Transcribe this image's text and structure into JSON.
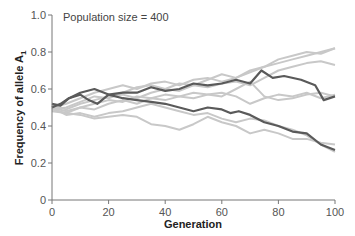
{
  "chart_data": {
    "type": "line",
    "title": "",
    "annotation": "Population size = 400",
    "xlabel": "Generation",
    "ylabel": "Frequency of allele A",
    "ylabel_subscript": "1",
    "xlim": [
      0,
      100
    ],
    "ylim": [
      0,
      1.0
    ],
    "xticks": [
      0,
      20,
      40,
      60,
      80,
      100
    ],
    "yticks": [
      0,
      0.2,
      0.4,
      0.6,
      0.8,
      1.0
    ],
    "xtick_labels": [
      "0",
      "20",
      "40",
      "60",
      "80",
      "100"
    ],
    "ytick_labels": [
      "0",
      "0.2",
      "0.4",
      "0.6",
      "0.8",
      "1.0"
    ],
    "grid": false,
    "legend": null,
    "colors": {
      "highlight": "#5a5a5a",
      "background_runs": "#c8c8c8",
      "axis": "#777777"
    },
    "series": [
      {
        "name": "run-highlight-1",
        "style": "dark",
        "x": [
          0,
          3,
          6,
          10,
          13,
          16,
          20,
          25,
          30,
          35,
          40,
          45,
          50,
          55,
          60,
          65,
          70,
          74,
          78,
          82,
          88,
          93,
          96,
          100
        ],
        "y": [
          0.5,
          0.52,
          0.55,
          0.57,
          0.54,
          0.52,
          0.57,
          0.58,
          0.58,
          0.61,
          0.59,
          0.6,
          0.63,
          0.62,
          0.63,
          0.65,
          0.63,
          0.7,
          0.66,
          0.67,
          0.65,
          0.62,
          0.54,
          0.56
        ]
      },
      {
        "name": "run-highlight-2",
        "style": "dark",
        "x": [
          0,
          3,
          6,
          10,
          15,
          20,
          25,
          30,
          35,
          40,
          45,
          50,
          55,
          60,
          63,
          66,
          70,
          75,
          80,
          85,
          90,
          95,
          100
        ],
        "y": [
          0.52,
          0.51,
          0.55,
          0.58,
          0.6,
          0.57,
          0.55,
          0.54,
          0.53,
          0.52,
          0.5,
          0.48,
          0.5,
          0.49,
          0.47,
          0.48,
          0.46,
          0.42,
          0.4,
          0.37,
          0.36,
          0.3,
          0.27
        ]
      },
      {
        "name": "run-3",
        "style": "light",
        "x": [
          0,
          5,
          10,
          15,
          20,
          25,
          30,
          35,
          40,
          45,
          50,
          55,
          60,
          65,
          70,
          75,
          80,
          85,
          90,
          95,
          100
        ],
        "y": [
          0.5,
          0.52,
          0.55,
          0.58,
          0.6,
          0.62,
          0.6,
          0.63,
          0.64,
          0.62,
          0.65,
          0.66,
          0.64,
          0.66,
          0.7,
          0.72,
          0.74,
          0.76,
          0.78,
          0.8,
          0.82
        ]
      },
      {
        "name": "run-4",
        "style": "light",
        "x": [
          0,
          5,
          10,
          15,
          20,
          25,
          30,
          35,
          40,
          45,
          50,
          55,
          60,
          65,
          70,
          75,
          80,
          85,
          90,
          95,
          100
        ],
        "y": [
          0.49,
          0.5,
          0.53,
          0.56,
          0.55,
          0.58,
          0.61,
          0.62,
          0.6,
          0.63,
          0.62,
          0.65,
          0.68,
          0.66,
          0.69,
          0.72,
          0.76,
          0.78,
          0.8,
          0.79,
          0.82
        ]
      },
      {
        "name": "run-5",
        "style": "light",
        "x": [
          0,
          5,
          10,
          15,
          20,
          25,
          30,
          35,
          40,
          45,
          50,
          55,
          60,
          65,
          70,
          75,
          80,
          85,
          90,
          95,
          100
        ],
        "y": [
          0.51,
          0.49,
          0.52,
          0.54,
          0.56,
          0.57,
          0.55,
          0.58,
          0.6,
          0.59,
          0.62,
          0.61,
          0.63,
          0.64,
          0.62,
          0.66,
          0.7,
          0.72,
          0.74,
          0.75,
          0.73
        ]
      },
      {
        "name": "run-6",
        "style": "light",
        "x": [
          0,
          5,
          10,
          15,
          20,
          25,
          30,
          35,
          40,
          45,
          50,
          55,
          60,
          65,
          70,
          75,
          80,
          85,
          90,
          95,
          100
        ],
        "y": [
          0.5,
          0.48,
          0.5,
          0.52,
          0.54,
          0.53,
          0.56,
          0.55,
          0.57,
          0.56,
          0.58,
          0.57,
          0.56,
          0.6,
          0.64,
          0.56,
          0.54,
          0.55,
          0.57,
          0.58,
          0.56
        ]
      },
      {
        "name": "run-7",
        "style": "light",
        "x": [
          0,
          5,
          10,
          15,
          20,
          25,
          30,
          35,
          40,
          45,
          50,
          55,
          60,
          65,
          70,
          75,
          80,
          85,
          90,
          95,
          100
        ],
        "y": [
          0.48,
          0.47,
          0.5,
          0.49,
          0.52,
          0.54,
          0.52,
          0.55,
          0.54,
          0.56,
          0.55,
          0.57,
          0.58,
          0.56,
          0.52,
          0.55,
          0.57,
          0.56,
          0.58,
          0.55,
          0.57
        ]
      },
      {
        "name": "run-8",
        "style": "light",
        "x": [
          0,
          5,
          10,
          15,
          20,
          25,
          30,
          35,
          40,
          45,
          50,
          55,
          60,
          65,
          70,
          75,
          80,
          85,
          90,
          95,
          100
        ],
        "y": [
          0.49,
          0.47,
          0.46,
          0.44,
          0.45,
          0.46,
          0.45,
          0.41,
          0.4,
          0.38,
          0.41,
          0.45,
          0.42,
          0.4,
          0.36,
          0.38,
          0.36,
          0.33,
          0.33,
          0.31,
          0.3
        ]
      },
      {
        "name": "run-9",
        "style": "light",
        "x": [
          0,
          5,
          10,
          15,
          20,
          25,
          30,
          35,
          40,
          45,
          50,
          55,
          60,
          65,
          70,
          75,
          80,
          85,
          90,
          95,
          100
        ],
        "y": [
          0.5,
          0.46,
          0.47,
          0.45,
          0.47,
          0.48,
          0.5,
          0.52,
          0.5,
          0.48,
          0.46,
          0.47,
          0.44,
          0.42,
          0.44,
          0.43,
          0.4,
          0.38,
          0.35,
          0.3,
          0.26
        ]
      }
    ]
  }
}
